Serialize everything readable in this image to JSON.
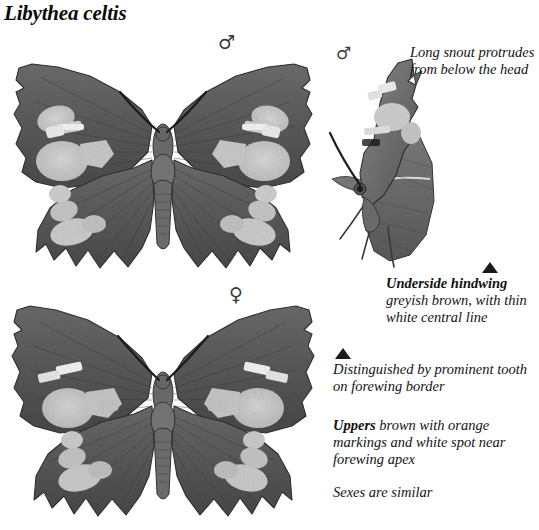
{
  "page": {
    "title": "Libythea celtis",
    "background_color": "#ffffff",
    "text_color": "#121212"
  },
  "symbols": {
    "male_upperside": "♂",
    "male_underside": "♂",
    "female_upperside": "♀"
  },
  "pointers": {
    "underside_hindwing_marker": "▲",
    "forewing_tooth_marker": "▲"
  },
  "annotations": {
    "snout": {
      "text": "Long snout protrudes from below the head"
    },
    "underside": {
      "lead": "Underside hindwing",
      "text": "greyish brown, with thin white central line"
    },
    "tooth": {
      "text": "Distinguished by prominent tooth on forewing border"
    },
    "uppers": {
      "lead": "Uppers",
      "text": "brown with orange markings and white spot near forewing apex"
    },
    "sexes": {
      "text": "Sexes are similar"
    }
  },
  "figures": {
    "male_upperside": {
      "name": "Male upperside, wings spread",
      "sex": "male",
      "view": "upperside"
    },
    "female_upperside": {
      "name": "Female upperside, wings spread",
      "sex": "female",
      "view": "upperside"
    },
    "male_underside": {
      "name": "Male underside, side view showing snout",
      "sex": "male",
      "view": "underside"
    }
  },
  "palette": {
    "wing_dark": "#5d5d5d",
    "wing_mid": "#6e6e6e",
    "wing_shadow": "#404040",
    "wing_patch": "#c9c9c9",
    "wing_patch_bright": "#f2f2f2",
    "body": "#6a6a6a",
    "outline": "#2b2b2b"
  }
}
